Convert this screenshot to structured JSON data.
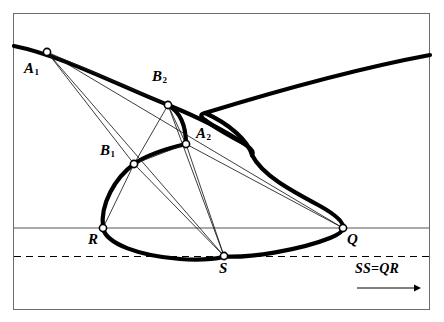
{
  "figure": {
    "colors": {
      "ink": "#000000",
      "frame": "#6b6b6b",
      "thin_line": "#1a1a1a",
      "background": "#ffffff"
    },
    "frame": {
      "x": 13,
      "y": 13,
      "width": 417,
      "height": 297
    },
    "guides": [
      {
        "name": "solid-horizontal-guide",
        "style": "solid",
        "y": 228
      },
      {
        "name": "dashed-horizontal-guide",
        "style": "dashed",
        "y": 256
      }
    ],
    "curve": {
      "name": "thick-s-curve",
      "stroke_width": 4.2,
      "description": "Continuous heavy curve entering at left edge, sweeping right and down to a cusp, doubling back to a left apex, rising to exit at the right edge, and looping through the lower lobe."
    },
    "points": [
      {
        "id": "A1",
        "label": "A",
        "sub": "1",
        "x": 47,
        "y": 52,
        "label_x": 24,
        "label_y": 68
      },
      {
        "id": "B2",
        "label": "B",
        "sub": "2",
        "x": 168,
        "y": 105,
        "label_x": 152,
        "label_y": 76
      },
      {
        "id": "A2",
        "label": "A",
        "sub": "2",
        "x": 186,
        "y": 144,
        "label_x": 196,
        "label_y": 133
      },
      {
        "id": "B1",
        "label": "B",
        "sub": "1",
        "x": 134,
        "y": 164,
        "label_x": 100,
        "label_y": 150
      },
      {
        "id": "R",
        "label": "R",
        "sub": "",
        "x": 103,
        "y": 228,
        "label_x": 88,
        "label_y": 238
      },
      {
        "id": "S",
        "label": "S",
        "sub": "",
        "x": 224,
        "y": 256,
        "label_x": 218,
        "label_y": 266
      },
      {
        "id": "Q",
        "label": "Q",
        "sub": "",
        "x": 343,
        "y": 228,
        "label_x": 347,
        "label_y": 238
      }
    ],
    "segments": [
      {
        "name": "segment-A1-B2",
        "from": "A1",
        "to": "B2"
      },
      {
        "name": "segment-A1-B1",
        "from": "A1",
        "to": "B1"
      },
      {
        "name": "segment-A1-S",
        "from": "A1",
        "to": "S"
      },
      {
        "name": "segment-A1-Q",
        "from": "A1",
        "to": "Q"
      },
      {
        "name": "segment-B2-B1",
        "from": "B2",
        "to": "B1"
      },
      {
        "name": "segment-B2-A2",
        "from": "B2",
        "to": "A2"
      },
      {
        "name": "segment-B2-S",
        "from": "B2",
        "to": "S"
      },
      {
        "name": "segment-B1-A2",
        "from": "B1",
        "to": "A2"
      },
      {
        "name": "segment-B1-R",
        "from": "B1",
        "to": "R"
      },
      {
        "name": "segment-B1-S",
        "from": "B1",
        "to": "S"
      },
      {
        "name": "segment-A2-S",
        "from": "A2",
        "to": "S"
      },
      {
        "name": "segment-A2-Q",
        "from": "A2",
        "to": "Q"
      }
    ],
    "annotation": {
      "name": "ss-equals-qr-note",
      "text": "SS=QR",
      "text_x": 355,
      "text_y": 268,
      "arrow": {
        "x1": 357,
        "y1": 288,
        "x2": 418,
        "y2": 288
      }
    }
  }
}
